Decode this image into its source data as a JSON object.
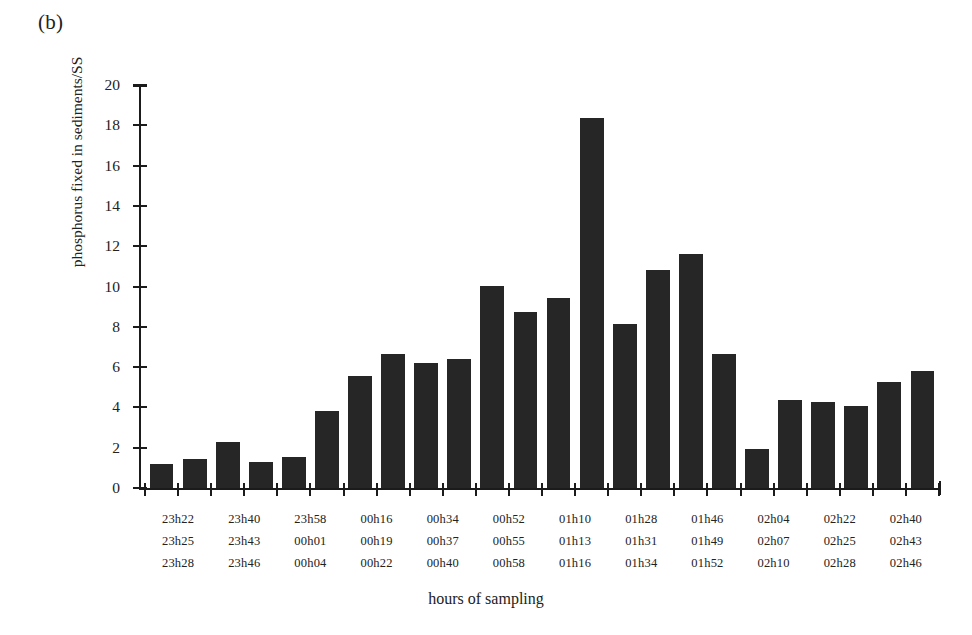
{
  "figure": {
    "panel_label": "(b)",
    "background_color": "#ffffff",
    "bar_color": "#262626",
    "axis_color": "#1b1b1b"
  },
  "chart_data": {
    "type": "bar",
    "title": "",
    "subtitle": "",
    "panel": "(b)",
    "xlabel": "hours of sampling",
    "ylabel": "phosphorus fixed in sediments/SS",
    "ylim": [
      0,
      20
    ],
    "ytick_labels": [
      "0",
      "2",
      "4",
      "6",
      "8",
      "10",
      "12",
      "14",
      "16",
      "18",
      "20"
    ],
    "ytick_values": [
      0,
      2,
      4,
      6,
      8,
      10,
      12,
      14,
      16,
      18,
      20
    ],
    "grid": false,
    "legend": null,
    "categories": [
      "23h22",
      "23h25",
      "23h28",
      "23h40",
      "23h43",
      "23h46",
      "23h58",
      "00h01",
      "00h04",
      "00h16",
      "00h19",
      "00h22",
      "00h34",
      "00h37",
      "00h40",
      "00h52",
      "00h55",
      "00h58",
      "01h10",
      "01h13",
      "01h16",
      "01h28",
      "01h31",
      "01h34"
    ],
    "values": [
      1.2,
      1.45,
      2.3,
      1.3,
      1.55,
      3.8,
      5.55,
      6.65,
      6.2,
      6.4,
      10.05,
      8.75,
      9.45,
      18.35,
      8.15,
      10.8,
      11.6,
      6.65,
      1.95,
      4.35,
      4.25,
      4.05,
      5.25,
      5.8
    ],
    "n_bars": 24,
    "xtick_label_rows": [
      [
        "23h22",
        "23h40",
        "23h58",
        "00h16",
        "00h34",
        "00h52",
        "01h10",
        "01h28",
        "01h46",
        "02h04",
        "02h22",
        "02h40"
      ],
      [
        "23h25",
        "23h43",
        "00h01",
        "00h19",
        "00h37",
        "00h55",
        "01h13",
        "01h31",
        "01h49",
        "02h07",
        "02h25",
        "02h43"
      ],
      [
        "23h28",
        "23h46",
        "00h04",
        "00h22",
        "00h40",
        "00h58",
        "01h16",
        "01h34",
        "01h52",
        "02h10",
        "02h28",
        "02h46"
      ]
    ]
  }
}
